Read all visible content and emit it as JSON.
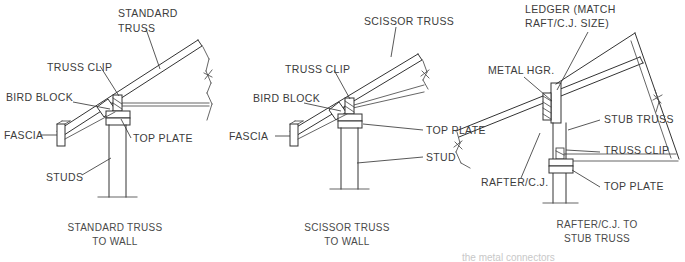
{
  "drawing": {
    "title": "Truss To Wall Connection Details",
    "line_color": "#333333",
    "text_color": "#3c3c3c",
    "background": "#ffffff"
  },
  "panels": [
    {
      "id": "standard-truss-to-wall",
      "caption_line1": "STANDARD TRUSS",
      "caption_line2": "TO WALL",
      "labels": [
        {
          "name": "standard-truss",
          "line1": "STANDARD",
          "line2": "TRUSS"
        },
        {
          "name": "truss-clip",
          "line1": "TRUSS CLIP"
        },
        {
          "name": "bird-block",
          "line1": "BIRD BLOCK"
        },
        {
          "name": "fascia",
          "line1": "FASCIA"
        },
        {
          "name": "top-plate",
          "line1": "TOP PLATE"
        },
        {
          "name": "studs",
          "line1": "STUDS"
        }
      ]
    },
    {
      "id": "scissor-truss-to-wall",
      "caption_line1": "SCISSOR TRUSS",
      "caption_line2": "TO WALL",
      "labels": [
        {
          "name": "scissor-truss",
          "line1": "SCISSOR TRUSS"
        },
        {
          "name": "truss-clip",
          "line1": "TRUSS CLIP"
        },
        {
          "name": "bird-block",
          "line1": "BIRD BLOCK"
        },
        {
          "name": "fascia",
          "line1": "FASCIA"
        },
        {
          "name": "top-plate",
          "line1": "TOP PLATE"
        },
        {
          "name": "stud",
          "line1": "STUD"
        }
      ]
    },
    {
      "id": "rafter-cj-to-stub-truss",
      "caption_line1": "RAFTER/C.J. TO",
      "caption_line2": "STUB TRUSS",
      "labels": [
        {
          "name": "ledger",
          "line1": "LEDGER (MATCH",
          "line2": "RAFT/C.J. SIZE)"
        },
        {
          "name": "metal-hgr",
          "line1": "METAL HGR."
        },
        {
          "name": "stub-truss",
          "line1": "STUB TRUSS"
        },
        {
          "name": "truss-clip",
          "line1": "TRUSS CLIP"
        },
        {
          "name": "rafter-cj",
          "line1": "RAFTER/C.J."
        },
        {
          "name": "top-plate",
          "line1": "TOP PLATE"
        }
      ]
    }
  ],
  "footer": {
    "clipped_text": "the metal connectors"
  }
}
